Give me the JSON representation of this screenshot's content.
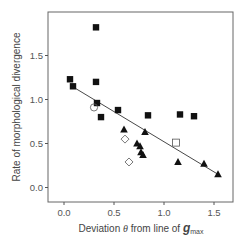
{
  "chart_data": {
    "type": "scatter",
    "title": "",
    "xlabel": "Deviation θ from line of g_max",
    "xlabel_parts": {
      "prefix": "Deviation ",
      "theta": "θ",
      "middle": " from line of ",
      "g": "g",
      "sub": "max"
    },
    "ylabel": "Rate of morphological divergence",
    "xlim": [
      -0.15,
      1.69
    ],
    "ylim": [
      -0.17,
      1.97
    ],
    "xticks": [
      0.0,
      0.5,
      1.0,
      1.5
    ],
    "xtick_labels": [
      "0.0",
      "0.5",
      "1.0",
      "1.5"
    ],
    "yticks": [
      0.0,
      0.5,
      1.0,
      1.5
    ],
    "ytick_labels": [
      "0.0",
      "0.5",
      "1.0",
      "1.5"
    ],
    "grid": false,
    "legend": null,
    "series": [
      {
        "name": "filled squares",
        "marker": "square-filled",
        "points": [
          [
            0.06,
            1.23
          ],
          [
            0.09,
            1.15
          ],
          [
            0.32,
            1.82
          ],
          [
            0.32,
            1.2
          ],
          [
            0.33,
            0.96
          ],
          [
            0.37,
            0.8
          ],
          [
            0.54,
            0.88
          ],
          [
            0.84,
            0.82
          ],
          [
            1.16,
            0.83
          ],
          [
            1.3,
            0.81
          ]
        ]
      },
      {
        "name": "filled triangles",
        "marker": "triangle-filled",
        "points": [
          [
            0.6,
            0.66
          ],
          [
            0.81,
            0.63
          ],
          [
            0.73,
            0.5
          ],
          [
            0.76,
            0.47
          ],
          [
            0.77,
            0.4
          ],
          [
            0.79,
            0.37
          ],
          [
            1.14,
            0.29
          ],
          [
            1.4,
            0.27
          ],
          [
            1.54,
            0.15
          ]
        ]
      },
      {
        "name": "open diamonds",
        "marker": "diamond-open",
        "points": [
          [
            0.61,
            0.55
          ],
          [
            0.65,
            0.29
          ]
        ]
      },
      {
        "name": "open circle",
        "marker": "circle-open",
        "points": [
          [
            0.3,
            0.91
          ]
        ]
      },
      {
        "name": "open square",
        "marker": "square-open",
        "points": [
          [
            1.12,
            0.51
          ]
        ]
      }
    ],
    "regression_line": {
      "x": [
        0.08,
        1.54
      ],
      "y": [
        1.15,
        0.15
      ]
    }
  },
  "colors": {
    "marker": "#111111",
    "axis": "#555555",
    "line": "#333333"
  }
}
